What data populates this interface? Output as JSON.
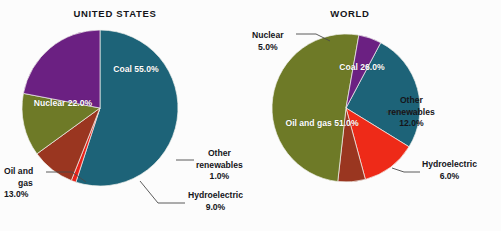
{
  "figure": {
    "background": "#fcfcfc",
    "label_color": "#15151a",
    "inner_label_color": "#ffffff"
  },
  "chart_data": [
    {
      "type": "pie",
      "title": "UNITED STATES",
      "xlabel": "",
      "ylabel": "",
      "categories": [
        "Coal",
        "Other renewables",
        "Hydroelectric",
        "Oil and gas",
        "Nuclear"
      ],
      "values": [
        55.0,
        1.0,
        9.0,
        13.0,
        22.0
      ],
      "value_labels": [
        "55.0%",
        "1.0%",
        "9.0%",
        "13.0%",
        "22.0%"
      ],
      "colors": [
        "#1d6378",
        "#e8231a",
        "#9a3620",
        "#6e7a27",
        "#6b2082"
      ],
      "label_placement": [
        "inside",
        "outside",
        "outside",
        "outside",
        "inside"
      ],
      "legend": "none",
      "grid": false
    },
    {
      "type": "pie",
      "title": "WORLD",
      "xlabel": "",
      "ylabel": "",
      "categories": [
        "Coal",
        "Other renewables",
        "Hydroelectric",
        "Oil and gas",
        "Nuclear"
      ],
      "values": [
        26.0,
        12.0,
        6.0,
        51.0,
        5.0
      ],
      "value_labels": [
        "26.0%",
        "12.0%",
        "6.0%",
        "51.0%",
        "5.0%"
      ],
      "colors": [
        "#1d6378",
        "#ee2a18",
        "#9a3620",
        "#6e7a27",
        "#6b2082"
      ],
      "label_placement": [
        "inside",
        "outside",
        "outside",
        "inside",
        "outside"
      ],
      "legend": "none",
      "grid": false
    }
  ],
  "united_states": {
    "title": "UNITED STATES",
    "coal": {
      "name": "Coal",
      "pct": "55.0%"
    },
    "nuclear": {
      "name": "Nuclear",
      "pct": "22.0%"
    },
    "oil_and_gas": {
      "name1": "Oil and",
      "name2": "gas",
      "pct": "13.0%"
    },
    "hydroelectric": {
      "name": "Hydroelectric",
      "pct": "9.0%"
    },
    "other_renewables": {
      "name1": "Other",
      "name2": "renewables",
      "pct": "1.0%"
    }
  },
  "world": {
    "title": "WORLD",
    "coal": {
      "name": "Coal",
      "pct": "26.0%"
    },
    "nuclear": {
      "name": "Nuclear",
      "pct": "5.0%"
    },
    "oil_and_gas": {
      "name": "Oil and gas",
      "pct": "51.0%"
    },
    "hydroelectric": {
      "name": "Hydroelectric",
      "pct": "6.0%"
    },
    "other_renewables": {
      "name1": "Other",
      "name2": "renewables",
      "pct": "12.0%"
    }
  }
}
